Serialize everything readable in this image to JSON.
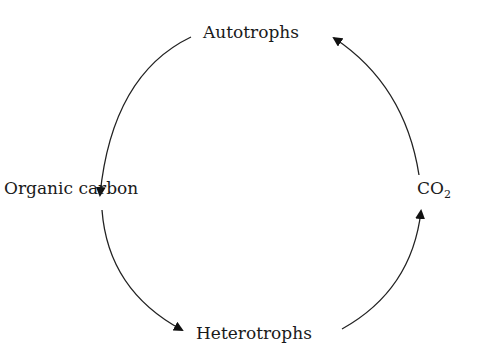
{
  "diagram": {
    "nodes": [
      {
        "id": "autotrophs",
        "label": "Autotrophs",
        "position": "top"
      },
      {
        "id": "organic_carbon",
        "label": "Organic carbon",
        "position": "left"
      },
      {
        "id": "heterotrophs",
        "label": "Heterotrophs",
        "position": "bottom"
      },
      {
        "id": "co2",
        "label": "CO",
        "subscript": "2",
        "position": "right"
      }
    ],
    "edges": [
      {
        "from": "autotrophs",
        "to": "organic_carbon"
      },
      {
        "from": "organic_carbon",
        "to": "heterotrophs"
      },
      {
        "from": "heterotrophs",
        "to": "co2"
      },
      {
        "from": "co2",
        "to": "autotrophs"
      }
    ],
    "colors": {
      "stroke": "#222222",
      "text": "#1a1a1a",
      "background": "#ffffff"
    }
  }
}
